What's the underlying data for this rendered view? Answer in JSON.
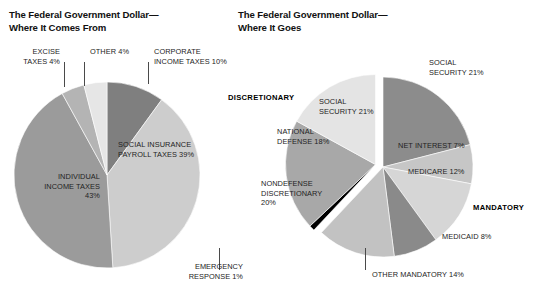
{
  "left": {
    "title": "The Federal Government Dollar—\nWhere It Comes From"
  },
  "right": {
    "title": "The Federal Government Dollar—\nWhere It Goes",
    "group_discretionary": "DISCRETIONARY",
    "group_mandatory": "MANDATORY"
  },
  "labels": {
    "l_excise": "EXCISE\nTAXES 4%",
    "l_other": "OTHER 4%",
    "l_corporate": "CORPORATE\nINCOME TAXES 10%",
    "l_social_insurance": "SOCIAL INSURANCE\nPAYROLL TAXES 39%",
    "l_individual": "INDIVIDUAL\nINCOME TAXES\n43%",
    "r_social_security_out": "SOCIAL\nSECURITY 21%",
    "r_social_security_in": "SOCIAL\nSECURITY 21%",
    "r_net_interest": "NET INTEREST 7%",
    "r_medicare": "MEDICARE 12%",
    "r_medicaid": "MEDICAID 8%",
    "r_other_mandatory": "OTHER MANDATORY 14%",
    "r_emergency": "EMERGENCY\nRESPONSE 1%",
    "r_nondefense": "NONDEFENSE\nDISCRETIONARY\n20%",
    "r_national_defense": "NATIONAL\nDEFENSE 18%"
  },
  "chart_data": [
    {
      "type": "pie",
      "title": "The Federal Government Dollar— Where It Comes From",
      "legend_position": "none",
      "categories": [
        "Corporate income taxes",
        "Social insurance payroll taxes",
        "Individual income taxes",
        "Excise taxes",
        "Other"
      ],
      "values": [
        10,
        39,
        43,
        4,
        4
      ],
      "unit": "percent",
      "slices": [
        {
          "label": "CORPORATE INCOME TAXES 10%",
          "value": 10,
          "color": "#7f7f7f",
          "start_deg": 0,
          "end_deg": 36
        },
        {
          "label": "SOCIAL INSURANCE PAYROLL TAXES 39%",
          "value": 39,
          "color": "#cdcdcd",
          "start_deg": 36,
          "end_deg": 176.4
        },
        {
          "label": "INDIVIDUAL INCOME TAXES 43%",
          "value": 43,
          "color": "#9b9b9b",
          "start_deg": 176.4,
          "end_deg": 331.2
        },
        {
          "label": "EXCISE TAXES 4%",
          "value": 4,
          "color": "#b4b4b4",
          "start_deg": 331.2,
          "end_deg": 345.6
        },
        {
          "label": "OTHER 4%",
          "value": 4,
          "color": "#e6e6e6",
          "start_deg": 345.6,
          "end_deg": 360
        }
      ]
    },
    {
      "type": "pie",
      "title": "The Federal Government Dollar— Where It Goes",
      "legend_position": "none",
      "groups": [
        "MANDATORY",
        "DISCRETIONARY"
      ],
      "categories": [
        "Social security",
        "Net interest",
        "Medicare",
        "Medicaid",
        "Other mandatory",
        "Emergency response",
        "Nondefense discretionary",
        "National defense"
      ],
      "values": [
        21,
        7,
        12,
        8,
        14,
        1,
        20,
        18
      ],
      "unit": "percent",
      "slices": [
        {
          "label": "SOCIAL SECURITY 21%",
          "value": 21,
          "group": "MANDATORY",
          "color": "#8c8c8c",
          "start_deg": 0,
          "end_deg": 75.6
        },
        {
          "label": "NET INTEREST 7%",
          "value": 7,
          "group": "MANDATORY",
          "color": "#c6c6c6",
          "start_deg": 75.6,
          "end_deg": 100.8
        },
        {
          "label": "MEDICARE 12%",
          "value": 12,
          "group": "MANDATORY",
          "color": "#d6d6d6",
          "start_deg": 100.8,
          "end_deg": 144
        },
        {
          "label": "MEDICAID 8%",
          "value": 8,
          "group": "MANDATORY",
          "color": "#8a8a8a",
          "start_deg": 144,
          "end_deg": 172.8
        },
        {
          "label": "OTHER MANDATORY 14%",
          "value": 14,
          "group": "MANDATORY",
          "color": "#c2c2c2",
          "start_deg": 172.8,
          "end_deg": 223.2
        },
        {
          "label": "EMERGENCY RESPONSE 1%",
          "value": 1,
          "group": "DISCRETIONARY",
          "color": "#000000",
          "start_deg": 223.2,
          "end_deg": 226.8
        },
        {
          "label": "NONDEFENSE DISCRETIONARY 20%",
          "value": 20,
          "group": "DISCRETIONARY",
          "color": "#a8a8a8",
          "start_deg": 226.8,
          "end_deg": 298.8
        },
        {
          "label": "NATIONAL DEFENSE 18%",
          "value": 18,
          "group": "DISCRETIONARY",
          "color": "#e4e4e4",
          "start_deg": 298.8,
          "end_deg": 360
        }
      ]
    }
  ]
}
